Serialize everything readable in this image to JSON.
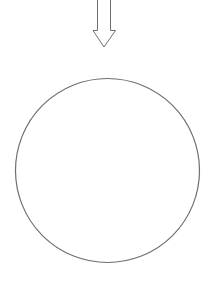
{
  "diagram": {
    "background": "#ffffff",
    "stroke_color": "#6e6e6e",
    "arrow": {
      "direction": "down",
      "shaft": {
        "x1": 97,
        "x2": 111,
        "y_top": 0,
        "y_bottom": 30
      },
      "head": {
        "left_x": 93,
        "right_x": 116,
        "top_y": 30,
        "tip_x": 104,
        "tip_y": 47
      },
      "fill": "#ffffff"
    },
    "circle": {
      "cx": 107.5,
      "cy": 170.5,
      "r": 92,
      "fill": "#ffffff"
    }
  }
}
